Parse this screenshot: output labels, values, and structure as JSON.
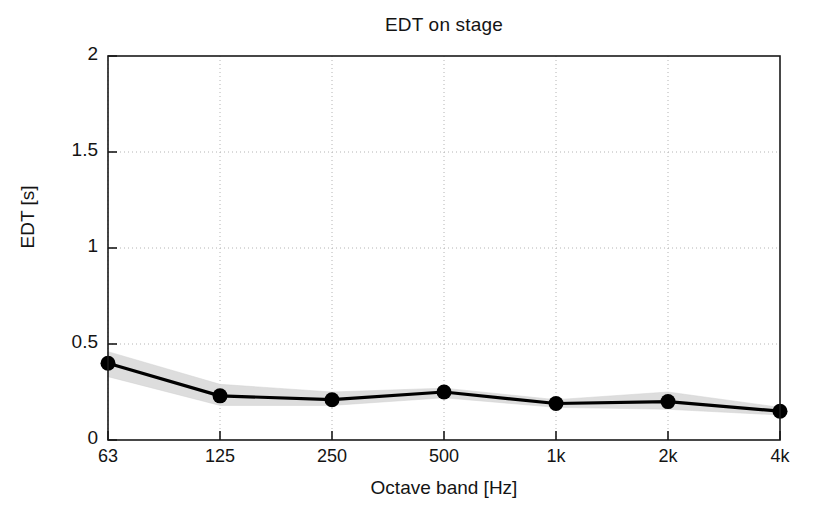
{
  "chart_data": {
    "type": "line",
    "title": "EDT on stage",
    "xlabel": "Octave band [Hz]",
    "ylabel": "EDT [s]",
    "categories": [
      "63",
      "125",
      "250",
      "500",
      "1k",
      "2k",
      "4k"
    ],
    "values": [
      0.4,
      0.23,
      0.21,
      0.25,
      0.19,
      0.2,
      0.15
    ],
    "band_lower": [
      0.33,
      0.18,
      0.18,
      0.22,
      0.17,
      0.16,
      0.13
    ],
    "band_upper": [
      0.46,
      0.29,
      0.25,
      0.27,
      0.21,
      0.25,
      0.17
    ],
    "series": [
      {
        "name": "EDT mean",
        "values": [
          0.4,
          0.23,
          0.21,
          0.25,
          0.19,
          0.2,
          0.15
        ],
        "marker": "filled-circle",
        "color": "#000000"
      },
      {
        "name": "standard deviation band",
        "type": "area",
        "lower": [
          0.33,
          0.18,
          0.18,
          0.22,
          0.17,
          0.16,
          0.13
        ],
        "upper": [
          0.46,
          0.29,
          0.25,
          0.27,
          0.21,
          0.25,
          0.17
        ],
        "color": "#d9d9d9"
      }
    ],
    "ylim": [
      0,
      2
    ],
    "yticks": [
      "0",
      "0.5",
      "1",
      "1.5",
      "2"
    ],
    "ytick_values": [
      0,
      0.5,
      1,
      1.5,
      2
    ],
    "xticks": [
      "63",
      "125",
      "250",
      "500",
      "1k",
      "2k",
      "4k"
    ],
    "grid": "dotted",
    "legend": "none",
    "axis_color": "#1a1a1a",
    "grid_color": "#b4b4b4",
    "background": "#ffffff"
  }
}
